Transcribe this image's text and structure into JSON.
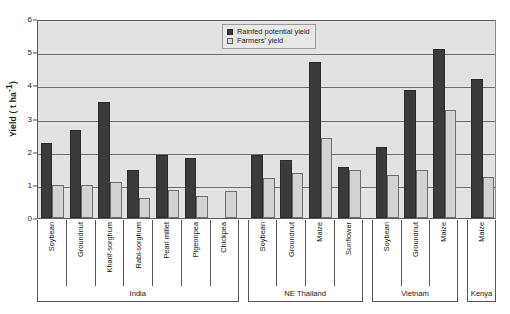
{
  "chart_data": {
    "type": "bar",
    "title": "",
    "xlabel": "",
    "ylabel": "Yield ( t ha-1)",
    "ylabel_base": "Yield ( t ha",
    "ylabel_sup": "-1",
    "ylabel_close": ")",
    "ylim": [
      0,
      6
    ],
    "ytick_labels": [
      "0",
      "1",
      "2",
      "3",
      "4",
      "5",
      "6"
    ],
    "ytick_values": [
      0,
      1,
      2,
      3,
      4,
      5,
      6
    ],
    "grid": true,
    "gridlines": [
      1,
      2,
      3,
      4,
      5
    ],
    "legend_position": "top-right",
    "legend": [
      "Rainfed potential yield",
      "Farmers' yield"
    ],
    "series": [
      {
        "name": "Rainfed potential yield",
        "color": "#3b3b3b",
        "values": [
          2.25,
          2.65,
          3.5,
          1.45,
          1.9,
          1.8,
          null,
          1.9,
          1.75,
          4.7,
          1.55,
          2.15,
          3.85,
          5.1,
          4.2
        ]
      },
      {
        "name": "Farmers' yield",
        "color": "#d2d2d2",
        "values": [
          1.0,
          1.0,
          1.1,
          0.6,
          0.85,
          0.65,
          0.8,
          1.2,
          1.35,
          2.4,
          1.45,
          1.3,
          1.45,
          3.25,
          1.25
        ]
      }
    ],
    "categories": [
      "Soybean",
      "Groundnut",
      "Kharif-sorghum",
      "Rabi-sorghum",
      "Pearl millet",
      "Pigeonpea",
      "Chickpea",
      "Soybean",
      "Groundnut",
      "Maize",
      "Sunflower",
      "Soybean",
      "Groundnut",
      "Maize",
      "Maize"
    ],
    "groups": [
      {
        "label": "India",
        "start": 0,
        "count": 7
      },
      {
        "label": "NE Thailand",
        "start": 7,
        "count": 4
      },
      {
        "label": "Vietnam",
        "start": 11,
        "count": 3
      },
      {
        "label": "Kenya",
        "start": 14,
        "count": 1
      }
    ]
  }
}
